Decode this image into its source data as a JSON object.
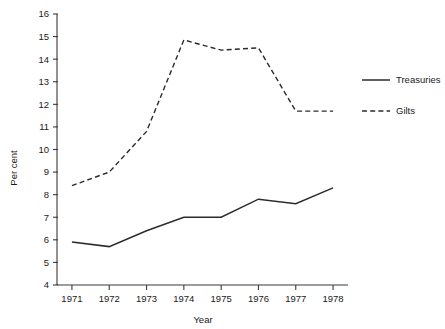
{
  "chart_data": {
    "type": "line",
    "title": "",
    "xlabel": "Year",
    "ylabel": "Per cent",
    "x": [
      1971,
      1972,
      1973,
      1974,
      1975,
      1976,
      1977,
      1978
    ],
    "xtick_labels": [
      "1971",
      "1972",
      "1973",
      "1974",
      "1975",
      "1976",
      "1977",
      "1978"
    ],
    "ytick_labels": [
      "4",
      "5",
      "6",
      "7",
      "8",
      "9",
      "10",
      "11",
      "12",
      "13",
      "14",
      "15",
      "16"
    ],
    "yticks": [
      4,
      5,
      6,
      7,
      8,
      9,
      10,
      11,
      12,
      13,
      14,
      15,
      16
    ],
    "xlim": [
      1970.6,
      1978.4
    ],
    "ylim": [
      4,
      16
    ],
    "grid": false,
    "legend_position": "right",
    "series": [
      {
        "name": "Treasuries",
        "style": "solid",
        "color": "#2b2b2b",
        "values": [
          5.9,
          5.7,
          6.4,
          7.0,
          7.0,
          7.8,
          7.6,
          8.3
        ]
      },
      {
        "name": "Gilts",
        "style": "dashed",
        "color": "#2b2b2b",
        "values": [
          8.4,
          9.0,
          10.8,
          14.85,
          14.4,
          14.5,
          11.7,
          11.7
        ]
      }
    ]
  },
  "legend": {
    "entries": [
      {
        "label": "Treasuries",
        "style": "solid"
      },
      {
        "label": "Gilts",
        "style": "dashed"
      }
    ]
  },
  "axes": {
    "y_axis_title": "Per cent",
    "x_axis_title": "Year"
  }
}
